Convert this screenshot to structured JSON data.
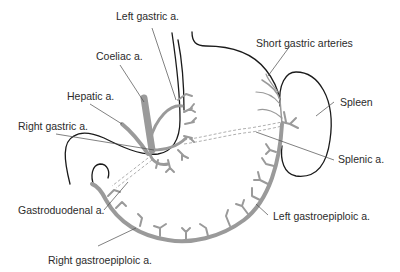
{
  "diagram": {
    "colors": {
      "outline": "#1a1a1a",
      "vessel": "#9a9a9a",
      "leader": "#4a4a4a",
      "text": "#2b2b2b",
      "background": "#ffffff"
    },
    "labels": {
      "left_gastric": "Left gastric a.",
      "coeliac": "Coeliac a.",
      "hepatic": "Hepatic a.",
      "right_gastric": "Right gastric a.",
      "short_gastric": "Short gastric arteries",
      "spleen": "Spleen",
      "splenic": "Splenic a.",
      "gastroduodenal": "Gastroduodenal a.",
      "left_gastroepiploic": "Left gastroepiploic a.",
      "right_gastroepiploic": "Right gastroepiploic a."
    }
  }
}
